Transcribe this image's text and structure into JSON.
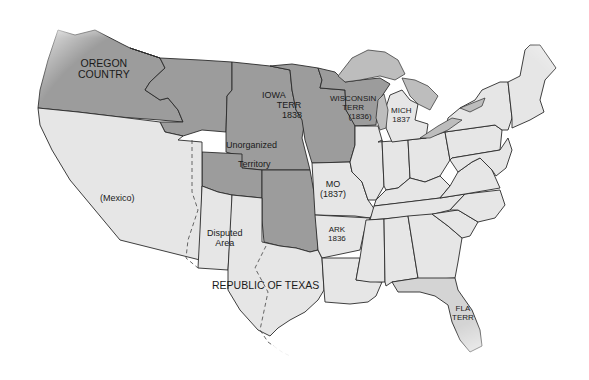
{
  "map": {
    "title": "United States territories c. 1836-1838",
    "colors": {
      "territory_fill": "#9c9c9c",
      "state_fill": "#e6e6e6",
      "florida_fill": "#d4d4d4",
      "lake_fill": "#b8b8b8",
      "border": "#2a2a2a",
      "background": "#ffffff"
    },
    "labels": {
      "oregon": [
        "OREGON",
        "COUNTRY"
      ],
      "iowa": [
        "IOWA",
        "TERR",
        "1838"
      ],
      "wisconsin": [
        "WISCONSIN",
        "TERR",
        "(1836)"
      ],
      "michigan": [
        "MICH",
        "1837"
      ],
      "unorganized": [
        "Unorganized",
        "Territory"
      ],
      "mexico": "(Mexico)",
      "missouri": [
        "MO",
        "(1837)"
      ],
      "arkansas": [
        "ARK",
        "1836"
      ],
      "disputed": [
        "Disputed",
        "Area"
      ],
      "texas": "REPUBLIC OF TEXAS",
      "florida": [
        "FLA",
        "TERR"
      ]
    },
    "legend": {
      "territory": "Territory (dark gray)",
      "state": "State (light gray)"
    }
  }
}
